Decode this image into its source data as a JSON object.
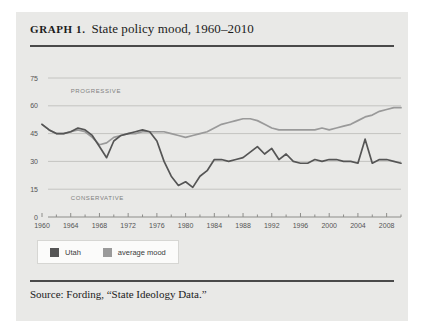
{
  "figure": {
    "graph_label": "GRAPH 1.",
    "title": "State policy mood, 1960–2010",
    "source": "Source: Fording, “State Ideology Data.”"
  },
  "legend": {
    "items": [
      {
        "label": "Utah",
        "color": "#555555"
      },
      {
        "label": "average mood",
        "color": "#9a9a9a"
      }
    ]
  },
  "zones": {
    "progressive": "PROGRESSIVE",
    "conservative": "CONSERVATIVE"
  },
  "colors": {
    "card_background": "#e9e9e7",
    "page_background": "#ffffff",
    "rule": "#4a4a4a",
    "gridline": "#c4c4c1",
    "utah": "#555555",
    "average": "#9a9a9a"
  },
  "chart_data": {
    "type": "line",
    "title": "State policy mood, 1960–2010",
    "xlabel": "",
    "ylabel": "",
    "xlim": [
      1960,
      2010
    ],
    "ylim": [
      0,
      75
    ],
    "yticks": [
      0,
      15,
      30,
      45,
      60,
      75
    ],
    "xticks": [
      1960,
      1964,
      1968,
      1972,
      1976,
      1980,
      1984,
      1988,
      1992,
      1996,
      2000,
      2004,
      2008
    ],
    "xtick_labels": [
      "1960",
      "1964",
      "1968",
      "1972",
      "1976",
      "1980",
      "1984",
      "1988",
      "1992",
      "1996",
      "2000",
      "2004",
      "2008"
    ],
    "ytick_labels": [
      "0",
      "15",
      "30",
      "45",
      "60",
      "75"
    ],
    "minor_xtick_interval": 2,
    "grid": "horizontal",
    "legend_position": "below-plot-left",
    "annotations": [
      {
        "text": "PROGRESSIVE",
        "x": 1964,
        "y": 67
      },
      {
        "text": "CONSERVATIVE",
        "x": 1964,
        "y": 9
      }
    ],
    "x": [
      1960,
      1961,
      1962,
      1963,
      1964,
      1965,
      1966,
      1967,
      1968,
      1969,
      1970,
      1971,
      1972,
      1973,
      1974,
      1975,
      1976,
      1977,
      1978,
      1979,
      1980,
      1981,
      1982,
      1983,
      1984,
      1985,
      1986,
      1987,
      1988,
      1989,
      1990,
      1991,
      1992,
      1993,
      1994,
      1995,
      1996,
      1997,
      1998,
      1999,
      2000,
      2001,
      2002,
      2003,
      2004,
      2005,
      2006,
      2007,
      2008,
      2009,
      2010
    ],
    "series": [
      {
        "name": "Utah",
        "color": "#555555",
        "values": [
          50,
          47,
          45,
          45,
          46,
          48,
          47,
          44,
          38,
          32,
          41,
          44,
          45,
          46,
          47,
          46,
          41,
          30,
          22,
          17,
          19,
          16,
          22,
          25,
          31,
          31,
          30,
          31,
          32,
          35,
          38,
          34,
          37,
          31,
          34,
          30,
          29,
          29,
          31,
          30,
          31,
          31,
          30,
          30,
          29,
          42,
          29,
          31,
          31,
          30,
          29
        ]
      },
      {
        "name": "average mood",
        "color": "#9a9a9a",
        "values": [
          50,
          47,
          45,
          45,
          46,
          47,
          46,
          43,
          39,
          40,
          43,
          44,
          45,
          45,
          46,
          46,
          46,
          46,
          45,
          44,
          43,
          44,
          45,
          46,
          48,
          50,
          51,
          52,
          53,
          53,
          52,
          50,
          48,
          47,
          47,
          47,
          47,
          47,
          47,
          48,
          47,
          48,
          49,
          50,
          52,
          54,
          55,
          57,
          58,
          59,
          59
        ]
      }
    ]
  }
}
